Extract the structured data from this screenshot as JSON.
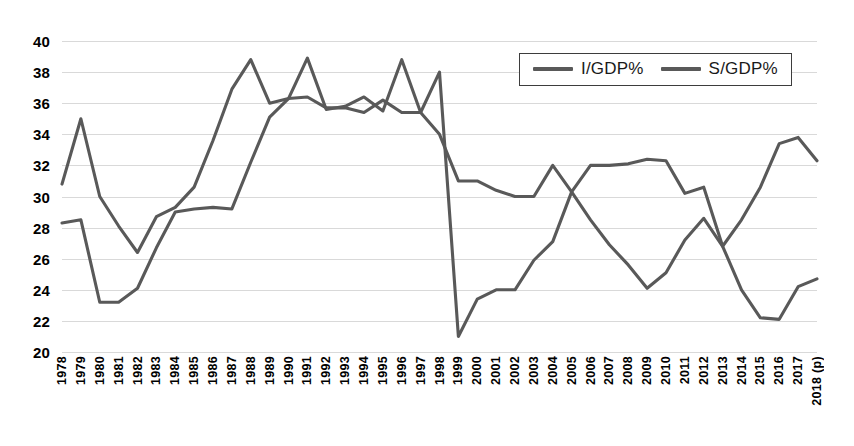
{
  "chart_data": {
    "type": "line",
    "title": "",
    "xlabel": "",
    "ylabel": "",
    "ylim": [
      20,
      40
    ],
    "ytick_step": 2,
    "yticks": [
      "40",
      "38",
      "36",
      "34",
      "32",
      "30",
      "28",
      "26",
      "24",
      "22",
      "20"
    ],
    "grid": true,
    "legend_position": "top-right",
    "categories": [
      "1978",
      "1979",
      "1980",
      "1981",
      "1982",
      "1983",
      "1984",
      "1985",
      "1986",
      "1987",
      "1988",
      "1989",
      "1990",
      "1991",
      "1992",
      "1993",
      "1994",
      "1995",
      "1996",
      "1997",
      "1998",
      "1999",
      "2000",
      "2001",
      "2002",
      "2003",
      "2004",
      "2005",
      "2006",
      "2007",
      "2008",
      "2009",
      "2010",
      "2011",
      "2012",
      "2013",
      "2014",
      "2015",
      "2016",
      "2017",
      "2018 (p)"
    ],
    "series": [
      {
        "name": "I/GDP%",
        "color": "#595959",
        "values": [
          28.3,
          28.5,
          23.2,
          23.2,
          24.1,
          26.7,
          29.0,
          29.2,
          29.3,
          29.2,
          32.2,
          35.1,
          36.3,
          36.4,
          35.7,
          35.7,
          35.4,
          36.2,
          35.4,
          35.4,
          38.0,
          21.0,
          23.4,
          24.0,
          24.0,
          25.9,
          27.1,
          30.3,
          28.5,
          26.9,
          25.6,
          24.1,
          25.1,
          27.2,
          28.6,
          26.8,
          24.0,
          22.2,
          22.1,
          24.2,
          24.7
        ]
      },
      {
        "name": "S/GDP%",
        "color": "#595959",
        "values": [
          30.8,
          35.0,
          30.0,
          28.1,
          26.4,
          28.7,
          29.3,
          30.6,
          33.6,
          36.9,
          38.8,
          36.0,
          36.3,
          38.9,
          35.6,
          35.8,
          36.4,
          35.5,
          38.8,
          35.4,
          34.0,
          31.0,
          31.0,
          30.4,
          30.0,
          30.0,
          32.0,
          30.3,
          32.0,
          32.0,
          32.1,
          32.4,
          32.3,
          30.2,
          30.6,
          26.8,
          28.5,
          30.6,
          33.4,
          33.8,
          32.3
        ]
      }
    ]
  },
  "legend": {
    "items": [
      {
        "label": "I/GDP%",
        "swatch_name": "legend-swatch-i-gdp"
      },
      {
        "label": "S/GDP%",
        "swatch_name": "legend-swatch-s-gdp"
      }
    ]
  },
  "colors": {
    "series": "#595959",
    "gridline": "#d9d9d9",
    "axis_text": "#000000"
  }
}
